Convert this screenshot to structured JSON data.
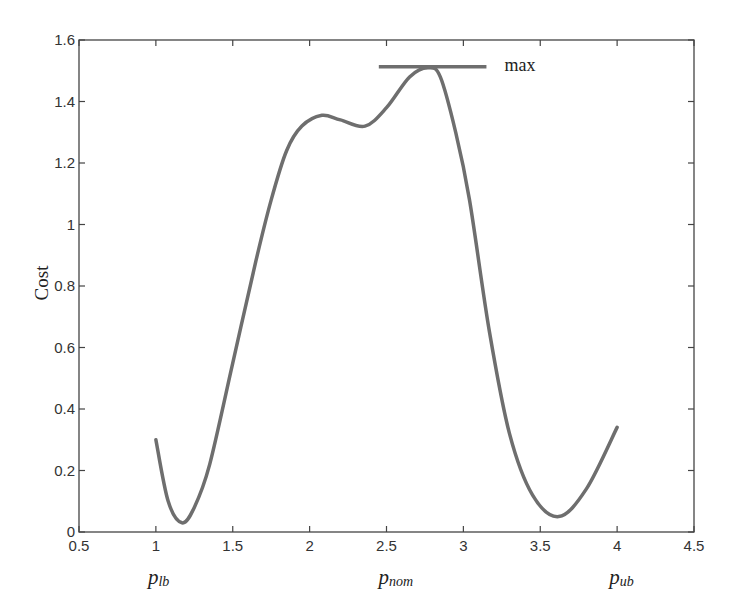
{
  "chart_data": {
    "type": "line",
    "title": "",
    "xlabel": "",
    "ylabel": "Cost",
    "xlim": [
      0.5,
      4.5
    ],
    "ylim": [
      0,
      1.6
    ],
    "grid": false,
    "legend": null,
    "xticks": [
      0.5,
      1,
      1.5,
      2,
      2.5,
      3,
      3.5,
      4,
      4.5
    ],
    "xtick_labels": [
      "0.5",
      "1",
      "1.5",
      "2",
      "2.5",
      "3",
      "3.5",
      "4",
      "4.5"
    ],
    "yticks": [
      0,
      0.2,
      0.4,
      0.6,
      0.8,
      1,
      1.2,
      1.4,
      1.6
    ],
    "ytick_labels": [
      "0",
      "0.2",
      "0.4",
      "0.6",
      "0.8",
      "1",
      "1.2",
      "1.4",
      "1.6"
    ],
    "series": [
      {
        "name": "Cost",
        "color": "#6e6e6e",
        "x": [
          1.0,
          1.08,
          1.17,
          1.25,
          1.35,
          1.5,
          1.65,
          1.75,
          1.85,
          1.95,
          2.08,
          2.2,
          2.36,
          2.5,
          2.65,
          2.77,
          2.85,
          2.95,
          3.04,
          3.17,
          3.3,
          3.45,
          3.62,
          3.8,
          4.0
        ],
        "y": [
          0.3,
          0.1,
          0.03,
          0.08,
          0.22,
          0.55,
          0.88,
          1.08,
          1.24,
          1.32,
          1.355,
          1.34,
          1.32,
          1.38,
          1.48,
          1.51,
          1.48,
          1.3,
          1.08,
          0.65,
          0.32,
          0.12,
          0.05,
          0.14,
          0.34
        ]
      }
    ],
    "annotations": [
      {
        "type": "hline",
        "label": "max",
        "y": 1.51,
        "x_start": 2.45,
        "x_end": 3.15,
        "color": "#6e6e6e"
      }
    ],
    "bound_labels": [
      {
        "base": "p",
        "sub": "lb",
        "x": 1.0
      },
      {
        "base": "p",
        "sub": "nom",
        "x": 2.5
      },
      {
        "base": "p",
        "sub": "ub",
        "x": 4.0
      }
    ]
  }
}
